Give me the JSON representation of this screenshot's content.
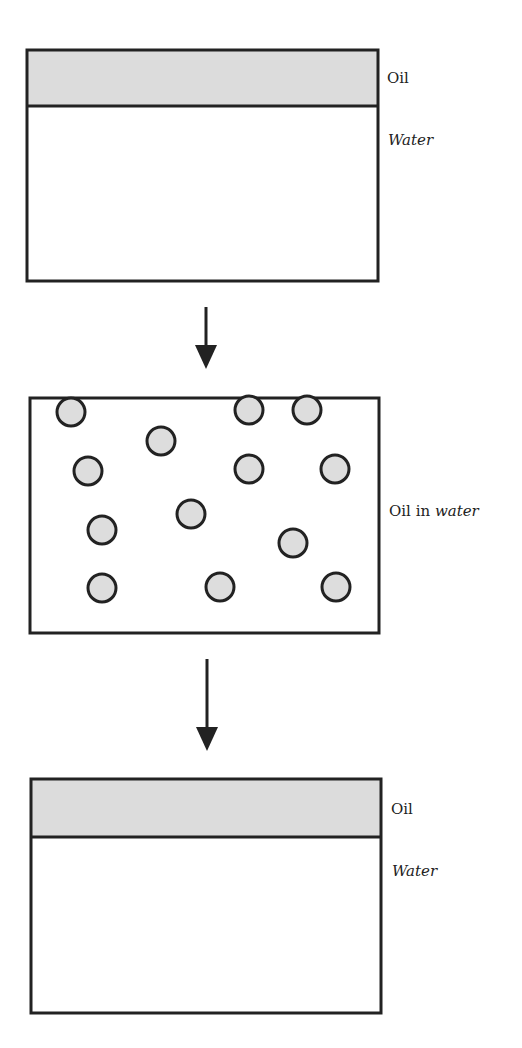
{
  "diagram": {
    "colors": {
      "stroke": "#222222",
      "oil_fill": "#dcdcdc",
      "droplet_fill": "#dddddd",
      "background": "#ffffff"
    },
    "stage1": {
      "oil_label": "Oil",
      "water_label": "Water"
    },
    "stage2": {
      "label_prefix": "Oil in ",
      "label_italic": "water",
      "droplets": [
        {
          "cx": 71,
          "cy": 412
        },
        {
          "cx": 249,
          "cy": 410
        },
        {
          "cx": 307,
          "cy": 410
        },
        {
          "cx": 161,
          "cy": 441
        },
        {
          "cx": 88,
          "cy": 471
        },
        {
          "cx": 249,
          "cy": 469
        },
        {
          "cx": 335,
          "cy": 469
        },
        {
          "cx": 102,
          "cy": 530
        },
        {
          "cx": 191,
          "cy": 514
        },
        {
          "cx": 293,
          "cy": 543
        },
        {
          "cx": 102,
          "cy": 588
        },
        {
          "cx": 220,
          "cy": 587
        },
        {
          "cx": 336,
          "cy": 587
        }
      ]
    },
    "stage3": {
      "oil_label": "Oil",
      "water_label": "Water"
    }
  }
}
